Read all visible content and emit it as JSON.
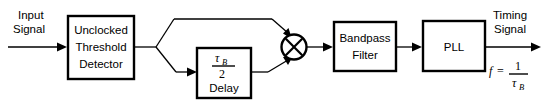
{
  "diagram": {
    "background_color": "#ffffff",
    "line_color": "#000000",
    "blocks": [
      {
        "id": "threshold-detector",
        "lines": [
          "Unclocked",
          "Threshold",
          "Detector"
        ]
      },
      {
        "id": "delay",
        "numerator": "τ",
        "numerator_sub": "B",
        "denominator": "2",
        "label": "Delay"
      },
      {
        "id": "bandpass-filter",
        "lines": [
          "Bandpass",
          "Filter"
        ]
      },
      {
        "id": "pll",
        "lines": [
          "PLL"
        ]
      }
    ],
    "mixer": {
      "id": "multiplier",
      "symbol": "⊗"
    },
    "input": {
      "line1": "Input",
      "line2": "Signal"
    },
    "output": {
      "line1": "Timing",
      "line2": "Signal",
      "equation": {
        "lhs": "f",
        "eq": "=",
        "numerator": "1",
        "denominator": "τ",
        "denominator_sub": "B"
      }
    }
  }
}
